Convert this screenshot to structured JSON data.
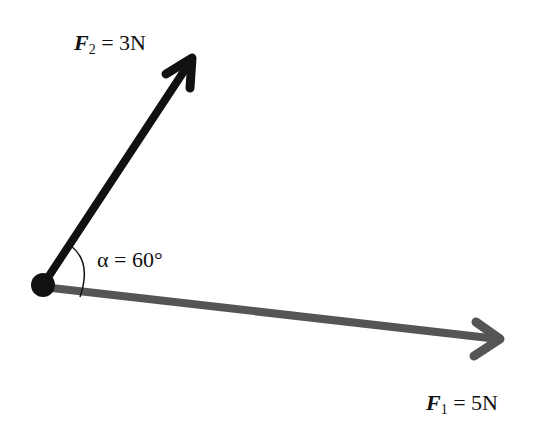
{
  "diagram": {
    "type": "force-vector-diagram",
    "forces": [
      {
        "id": "F1",
        "symbol": "F",
        "subscript": "1",
        "equals": "=",
        "value": "5N",
        "color": "#555555",
        "direction": "right, slightly downward"
      },
      {
        "id": "F2",
        "symbol": "F",
        "subscript": "2",
        "equals": "=",
        "value": "3N",
        "color": "#111111",
        "direction": "up-right"
      }
    ],
    "angle": {
      "symbol": "α",
      "equals": "=",
      "value": "60°"
    },
    "origin": {
      "shape": "dot",
      "color": "#111111"
    }
  }
}
